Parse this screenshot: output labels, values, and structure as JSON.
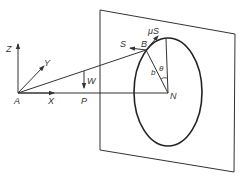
{
  "diagram": {
    "type": "mechanics-free-body",
    "colors": {
      "line": "#333333",
      "background": "#ffffff"
    },
    "labels": {
      "Z": "Z",
      "Y": "Y",
      "X": "X",
      "A": "A",
      "P": "P",
      "W": "W",
      "S": "S",
      "B": "B",
      "muS": "μS",
      "b": "b",
      "theta": "θ",
      "N": "N"
    },
    "points": {
      "A": [
        18,
        93
      ],
      "P": [
        84,
        93
      ],
      "N": [
        168,
        93
      ],
      "B": [
        146,
        50
      ],
      "circle_top": [
        166,
        39
      ]
    },
    "plane_corners": [
      [
        100,
        10
      ],
      [
        235,
        34
      ],
      [
        234,
        172
      ],
      [
        100,
        150
      ]
    ],
    "ellipse": {
      "cx": 168,
      "cy": 92,
      "rx": 34,
      "ry": 54
    }
  }
}
